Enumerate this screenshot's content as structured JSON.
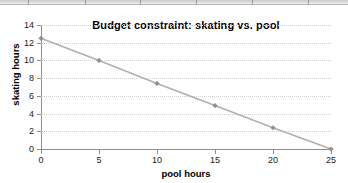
{
  "top_strip": {
    "separator_positions": [
      28,
      85,
      140,
      196,
      252,
      308
    ]
  },
  "chart_data": {
    "type": "line",
    "title": "Budget constraint: skating vs. pool",
    "xlabel": "pool hours",
    "ylabel": "skating hours",
    "x": [
      0,
      5,
      10,
      15,
      20,
      25
    ],
    "values": [
      12.5,
      10,
      7.4,
      4.9,
      2.4,
      0
    ],
    "series": [
      {
        "name": "budget constraint",
        "values": [
          12.5,
          10,
          7.4,
          4.9,
          2.4,
          0
        ]
      }
    ],
    "xlim": [
      0,
      25
    ],
    "ylim": [
      0,
      14
    ],
    "x_ticks": [
      "0",
      "5",
      "10",
      "15",
      "20",
      "25"
    ],
    "y_ticks": [
      "0",
      "2",
      "4",
      "6",
      "8",
      "10",
      "12",
      "14"
    ],
    "x_tick_values": [
      0,
      5,
      10,
      15,
      20,
      25
    ],
    "y_tick_values": [
      0,
      2,
      4,
      6,
      8,
      10,
      12,
      14
    ],
    "grid": "horizontal-dotted",
    "legend": "none",
    "line_color": "#b0b0b0",
    "marker_color": "#8f8f8f",
    "marker_shape": "diamond",
    "axis_color": "#8d8d8d",
    "gridline_color": "#d2d2d2",
    "text_color": "#1a1a1a"
  }
}
